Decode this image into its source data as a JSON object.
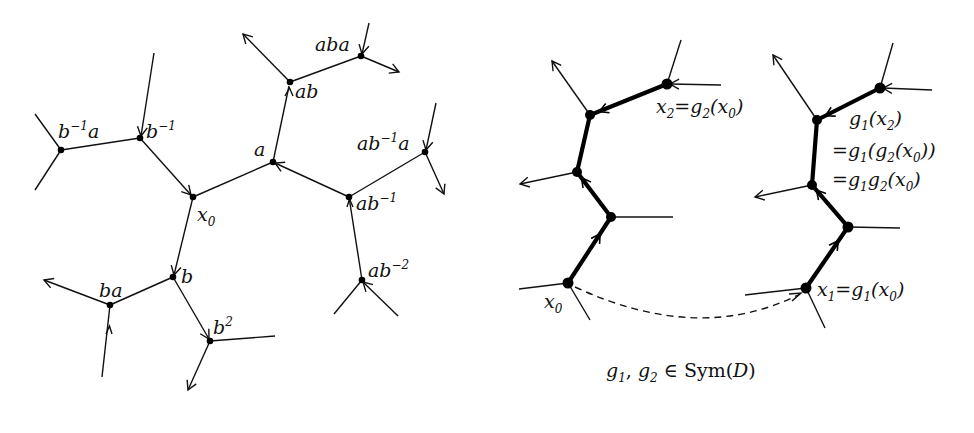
{
  "figure": {
    "left_panel": {
      "description": "Cayley graph portion of free group on a,b with base vertex x0",
      "vertices": [
        {
          "id": "x0",
          "label": "x",
          "sub": "0",
          "sup": "",
          "x": 193,
          "y": 197
        },
        {
          "id": "a",
          "label": "a",
          "sub": "",
          "sup": "",
          "x": 273,
          "y": 162
        },
        {
          "id": "ab",
          "label": "ab",
          "sub": "",
          "sup": "",
          "x": 290,
          "y": 82
        },
        {
          "id": "aba",
          "label": "aba",
          "sub": "",
          "sup": "",
          "x": 361,
          "y": 56
        },
        {
          "id": "ab-1",
          "label": "ab",
          "sub": "",
          "sup": "−1",
          "x": 349,
          "y": 197
        },
        {
          "id": "ab-1a",
          "label": "ab",
          "sub": "",
          "sup": "−1",
          "tail": "a",
          "x": 425,
          "y": 152
        },
        {
          "id": "ab-2",
          "label": "ab",
          "sub": "",
          "sup": "−2",
          "x": 362,
          "y": 280
        },
        {
          "id": "b-1",
          "label": "b",
          "sub": "",
          "sup": "−1",
          "x": 140,
          "y": 138
        },
        {
          "id": "b-1a",
          "label": "b",
          "sub": "",
          "sup": "−1",
          "tail": "a",
          "x": 61,
          "y": 150
        },
        {
          "id": "b",
          "label": "b",
          "sub": "",
          "sup": "",
          "x": 173,
          "y": 277
        },
        {
          "id": "ba",
          "label": "ba",
          "sub": "",
          "sup": "",
          "x": 110,
          "y": 305
        },
        {
          "id": "b2",
          "label": "b",
          "sub": "",
          "sup": "2",
          "x": 210,
          "y": 341
        }
      ],
      "labels": {
        "x0": "x",
        "x0_sub": "0",
        "a": "a",
        "ab": "ab",
        "aba": "aba",
        "ab_inv": "ab",
        "ab_inv_sup": "−1",
        "ab_inv_a": "ab",
        "ab_inv_a_sup": "−1",
        "ab_inv_a_tail": "a",
        "ab_inv2": "ab",
        "ab_inv2_sup": "−2",
        "b_inv": "b",
        "b_inv_sup": "−1",
        "b_inv_a": "b",
        "b_inv_a_sup": "−1",
        "b_inv_a_tail": "a",
        "b": "b",
        "ba": "ba",
        "b2": "b",
        "b2_sup": "2"
      }
    },
    "right_panel": {
      "description": "Two isometric copies of a path; symmetries g1, g2 acting on base vertex x0",
      "labels": {
        "x0": "x",
        "x0_sub": "0",
        "x2_eq": "x",
        "x2_sub": "2",
        "x2_rhs": "=g",
        "x2_rhs_sub": "2",
        "x2_arg": "(x",
        "x2_arg_sub": "0",
        "x2_close": ")",
        "x1_lhs": "x",
        "x1_sub": "1",
        "x1_rhs": "=g",
        "x1_rhs_sub": "1",
        "x1_arg": "(x",
        "x1_arg_sub": "0",
        "x1_close": ")",
        "g1x2_line1": "g",
        "g1x2_line1_sub": "1",
        "g1x2_line1_arg": "(x",
        "g1x2_line1_arg_sub": "2",
        "g1x2_line1_close": ")",
        "g1x2_line2_a": "=g",
        "g1x2_line2_a_sub": "1",
        "g1x2_line2_b": "(g",
        "g1x2_line2_b_sub": "2",
        "g1x2_line2_c": "(x",
        "g1x2_line2_c_sub": "0",
        "g1x2_line2_close": "))",
        "g1x2_line3_a": "=g",
        "g1x2_line3_a_sub": "1",
        "g1x2_line3_b": "g",
        "g1x2_line3_b_sub": "2",
        "g1x2_line3_c": "(x",
        "g1x2_line3_c_sub": "0",
        "g1x2_line3_close": ")"
      },
      "caption": {
        "g1": "g",
        "g1_sub": "1",
        "comma": ", ",
        "g2": "g",
        "g2_sub": "2",
        "member": " ∈ ",
        "sym": "Sym(",
        "D": "D",
        "close": ")"
      },
      "left_chain": [
        {
          "id": "x0",
          "x": 568,
          "y": 283
        },
        {
          "id": "n2",
          "x": 611,
          "y": 217
        },
        {
          "id": "n3",
          "x": 577,
          "y": 172
        },
        {
          "id": "n4",
          "x": 590,
          "y": 115
        },
        {
          "id": "x2",
          "x": 667,
          "y": 84
        }
      ],
      "right_chain": [
        {
          "id": "x1",
          "x": 806,
          "y": 288
        },
        {
          "id": "m2",
          "x": 848,
          "y": 227
        },
        {
          "id": "m3",
          "x": 812,
          "y": 185
        },
        {
          "id": "m4",
          "x": 817,
          "y": 120
        },
        {
          "id": "m5",
          "x": 880,
          "y": 88
        }
      ],
      "dashed_arrow": {
        "from": "x0",
        "to": "x1"
      }
    }
  }
}
